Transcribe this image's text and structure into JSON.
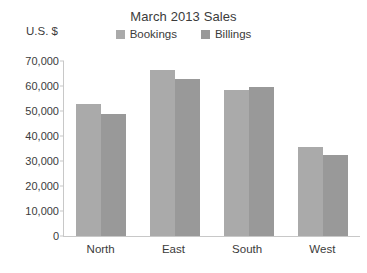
{
  "chart_data": {
    "type": "bar",
    "title": "March 2013 Sales",
    "xlabel": "",
    "ylabel": "U.S. $",
    "categories": [
      "North",
      "East",
      "South",
      "West"
    ],
    "series": [
      {
        "name": "Bookings",
        "color": "#aaaaaa",
        "values": [
          53000,
          66500,
          58500,
          35500
        ]
      },
      {
        "name": "Billings",
        "color": "#999999",
        "values": [
          49000,
          63000,
          59500,
          32500
        ]
      }
    ],
    "ylim": [
      0,
      70000
    ],
    "ytick_values": [
      0,
      10000,
      20000,
      30000,
      40000,
      50000,
      60000,
      70000
    ],
    "ytick_labels": [
      "0",
      "10,000",
      "20,000",
      "30,000",
      "40,000",
      "50,000",
      "60,000",
      "70,000"
    ],
    "grid": false,
    "legend_position": "top-center",
    "axis_color": "#c8c8c8",
    "text_color": "#3b3b3b",
    "background": "#ffffff"
  }
}
